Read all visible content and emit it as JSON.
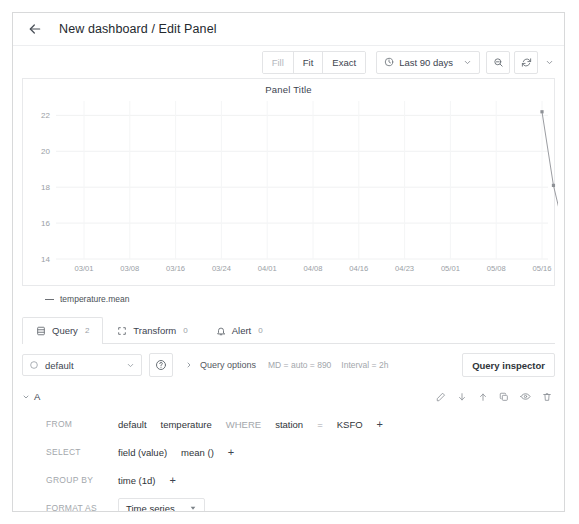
{
  "header": {
    "back_icon": "arrow-left-icon",
    "title": "New dashboard / Edit Panel"
  },
  "toolbar": {
    "fill_label": "Fill",
    "fit_label": "Fit",
    "exact_label": "Exact",
    "time_range": "Last 90 days",
    "clock_icon": "clock-icon",
    "zoom_out_icon": "zoom-out-icon",
    "refresh_icon": "refresh-icon",
    "chevron_icon": "chevron-down-icon"
  },
  "panel": {
    "title": "Panel Title",
    "legend_label": "temperature.mean"
  },
  "chart_data": {
    "type": "line",
    "title": "Panel Title",
    "xlabel": "",
    "ylabel": "",
    "ylim": [
      14,
      22.8
    ],
    "yticks": [
      14,
      16,
      18,
      20,
      22
    ],
    "xticks": [
      "03/01",
      "03/08",
      "03/16",
      "03/24",
      "04/01",
      "04/08",
      "04/16",
      "04/23",
      "05/01",
      "05/08",
      "05/16"
    ],
    "grid": true,
    "legend_position": "bottom-left",
    "series": [
      {
        "name": "temperature.mean",
        "color": "#8e9196",
        "points": [
          {
            "x": "05/16",
            "y": 22.2
          },
          {
            "x": "05/18",
            "y": 18.1
          },
          {
            "x": "05/20",
            "y": 15.4
          },
          {
            "x": "05/21",
            "y": 15.4
          },
          {
            "x": "05/22",
            "y": 14.9
          },
          {
            "x": "05/23",
            "y": 15.2
          },
          {
            "x": "05/24",
            "y": 14.7
          },
          {
            "x": "05/25",
            "y": 14.4
          }
        ]
      }
    ]
  },
  "tabs": [
    {
      "label": "Query",
      "count": "2",
      "icon": "database-icon",
      "active": true
    },
    {
      "label": "Transform",
      "count": "0",
      "icon": "transform-icon",
      "active": false
    },
    {
      "label": "Alert",
      "count": "0",
      "icon": "bell-icon",
      "active": false
    }
  ],
  "datasource": {
    "name": "default",
    "icon": "datasource-icon",
    "chevron_icon": "chevron-down-icon",
    "help_icon": "help-circle-icon"
  },
  "query_options": {
    "caret_icon": "chevron-right-icon",
    "label": "Query options",
    "max_data_points": "MD = auto = 890",
    "interval": "Interval = 2h"
  },
  "query_inspector": {
    "label": "Query inspector"
  },
  "query": {
    "ref_id": "A",
    "caret_icon": "chevron-down-icon",
    "actions": [
      {
        "icon": "pencil-icon",
        "name": "edit-query"
      },
      {
        "icon": "arrow-down-icon",
        "name": "move-query-down"
      },
      {
        "icon": "arrow-up-icon",
        "name": "move-query-up"
      },
      {
        "icon": "copy-icon",
        "name": "duplicate-query"
      },
      {
        "icon": "eye-icon",
        "name": "toggle-query-visibility"
      },
      {
        "icon": "trash-icon",
        "name": "remove-query"
      }
    ],
    "from": {
      "label": "FROM",
      "policy": "default",
      "measurement": "temperature",
      "where_label": "WHERE",
      "tag_key": "station",
      "operator": "=",
      "tag_value": "KSFO",
      "add": "+"
    },
    "select": {
      "label": "SELECT",
      "field": "field (value)",
      "aggregate": "mean ()",
      "add": "+"
    },
    "group_by": {
      "label": "GROUP BY",
      "time": "time (1d)",
      "add": "+"
    },
    "format_as": {
      "label": "FORMAT AS",
      "value": "Time series",
      "chevron_icon": "chevron-down-icon"
    },
    "alias_by": {
      "label": "ALIAS BY",
      "value": "",
      "placeholder": "Naming pattern"
    }
  }
}
